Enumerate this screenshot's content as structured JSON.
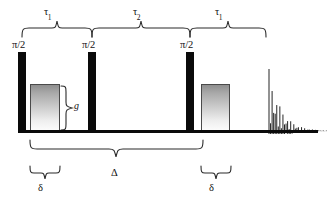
{
  "figure": {
    "name": "nmr-pulse-sequence",
    "type": "pulsed-field-gradient stimulated echo (PGSTE) pulse sequence diagram",
    "background_color": "#ffffff",
    "line_color": "#0a0a0a",
    "brace_color": "#2b2b2b"
  },
  "rf_pulses": [
    {
      "id": "rf-1",
      "label": "π/2",
      "x": 18,
      "width": 8
    },
    {
      "id": "rf-2",
      "label": "π/2",
      "x": 88,
      "width": 8
    },
    {
      "id": "rf-3",
      "label": "π/2",
      "x": 186,
      "width": 8
    }
  ],
  "gradient_pulses": [
    {
      "id": "grad-1",
      "x": 30,
      "width": 30,
      "amplitude_label": "g"
    },
    {
      "id": "grad-2",
      "x": 201,
      "width": 29,
      "amplitude_label": ""
    }
  ],
  "amplitude": {
    "label": "g",
    "description": "gradient amplitude brace"
  },
  "top_intervals": [
    {
      "id": "tau-1-first",
      "symbol": "τ",
      "subscript": "1",
      "from": 22,
      "to": 92
    },
    {
      "id": "tau-2",
      "symbol": "τ",
      "subscript": "2",
      "from": 92,
      "to": 190
    },
    {
      "id": "tau-1-second",
      "symbol": "τ",
      "subscript": "1",
      "from": 190,
      "to": 266
    }
  ],
  "bottom_intervals": [
    {
      "id": "big-delta",
      "symbol": "Δ",
      "subscript": "",
      "from": 30,
      "to": 203
    },
    {
      "id": "delta-left",
      "symbol": "δ",
      "subscript": "",
      "from": 30,
      "to": 60
    },
    {
      "id": "delta-right",
      "symbol": "δ",
      "subscript": "",
      "from": 201,
      "to": 231
    }
  ],
  "labels": {
    "tau1_a": "τ",
    "tau1_a_sub": "1",
    "tau2": "τ",
    "tau2_sub": "2",
    "tau1_b": "τ",
    "tau1_b_sub": "1",
    "big_delta": "Δ",
    "delta_left": "δ",
    "delta_right": "δ",
    "pulse_1": "π/2",
    "pulse_2": "π/2",
    "pulse_3": "π/2",
    "gradient_amplitude": "g"
  },
  "fid": {
    "id": "fid-signal",
    "description": "damped free induction decay echo",
    "start_x": 269,
    "baseline_y": 131,
    "peak_amplitude": 62,
    "decay_constant": 0.085,
    "period_px": 3.6,
    "n_lines": 38,
    "color": "#1a1a1a"
  }
}
